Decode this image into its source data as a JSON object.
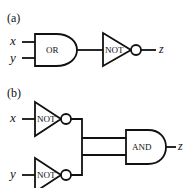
{
  "diagram": {
    "panel_a": {
      "label": "(a)",
      "inputs": [
        "x",
        "y"
      ],
      "gates": [
        {
          "type": "OR",
          "label": "OR"
        },
        {
          "type": "NOT",
          "label": "NOT"
        }
      ],
      "output": "z"
    },
    "panel_b": {
      "label": "(b)",
      "inputs": [
        "x",
        "y"
      ],
      "gates": [
        {
          "type": "NOT",
          "label": "NOT",
          "input": "x"
        },
        {
          "type": "NOT",
          "label": "NOT",
          "input": "y"
        },
        {
          "type": "AND",
          "label": "AND"
        }
      ],
      "output": "z"
    }
  }
}
